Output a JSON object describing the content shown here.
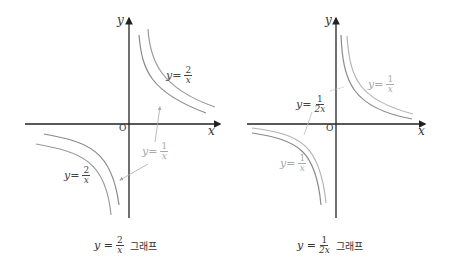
{
  "colors": {
    "axis": "#222222",
    "curve_dark": "#8a8a8a",
    "curve_light": "#b4b4b4",
    "label_dark": "#444444",
    "label_light": "#a8a8a8"
  },
  "left_graph": {
    "axis_x_label": "x",
    "axis_y_label": "y",
    "origin_label": "O",
    "curves": [
      {
        "equation": "y=2/x",
        "label_prefix": "y=",
        "num": "2",
        "den": "x",
        "style": "dark"
      },
      {
        "equation": "y=1/x",
        "label_prefix": "y=",
        "num": "1",
        "den": "x",
        "style": "light"
      }
    ],
    "caption": {
      "prefix": "y =",
      "num": "2",
      "den": "x",
      "suffix": "그래프"
    }
  },
  "right_graph": {
    "axis_x_label": "x",
    "axis_y_label": "y",
    "origin_label": "O",
    "curves": [
      {
        "equation": "y=1/(2x)",
        "label_prefix": "y=",
        "num": "1",
        "den": "2x",
        "style": "dark"
      },
      {
        "equation": "y=1/x",
        "label_prefix": "y=",
        "num": "1",
        "den": "x",
        "style": "light"
      }
    ],
    "caption": {
      "prefix": "y =",
      "num": "1",
      "den": "2x",
      "suffix": "그래프"
    }
  }
}
